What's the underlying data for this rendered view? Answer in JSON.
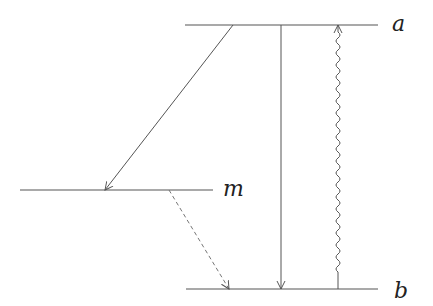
{
  "diagram": {
    "type": "energy-level diagram",
    "levels": [
      {
        "id": "a",
        "label": "a",
        "y": 25,
        "x1": 185,
        "x2": 378
      },
      {
        "id": "m",
        "label": "m",
        "y": 190,
        "x1": 20,
        "x2": 213
      },
      {
        "id": "b",
        "label": "b",
        "y": 289,
        "x1": 186,
        "x2": 378
      }
    ],
    "transitions": [
      {
        "from": "a",
        "to": "m",
        "style": "solid",
        "direction": "down"
      },
      {
        "from": "m",
        "to": "b",
        "style": "dashed",
        "direction": "down"
      },
      {
        "from": "a",
        "to": "b",
        "style": "solid",
        "direction": "down"
      },
      {
        "from": "b",
        "to": "a",
        "style": "wavy",
        "direction": "up"
      }
    ],
    "colors": {
      "line": "#555555",
      "text": "#222222"
    }
  }
}
